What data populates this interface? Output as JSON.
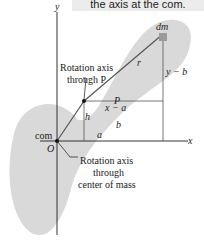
{
  "caption": "the axis at the com.",
  "colors": {
    "body_fill": "#d9d9d9",
    "line": "#555555",
    "axis": "#333333",
    "dm_fill": "#9a9a9a",
    "caption_bg": "#ececec"
  },
  "labels": {
    "y_axis": "y",
    "x_axis": "x",
    "dm": "dm",
    "r": "r",
    "y_minus_b": "y − b",
    "x_minus_a": "x − a",
    "h": "h",
    "b": "b",
    "a": "a",
    "P": "P",
    "com": "com",
    "O": "O",
    "axis_P_line1": "Rotation axis",
    "axis_P_line2": "through P",
    "axis_com_line1": "Rotation axis",
    "axis_com_line2": "through",
    "axis_com_line3": "center of mass"
  }
}
